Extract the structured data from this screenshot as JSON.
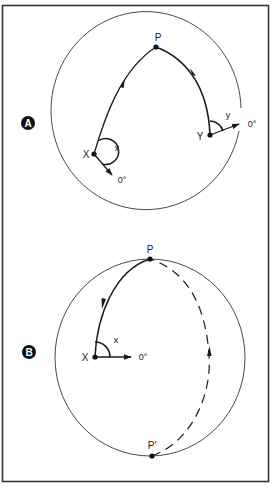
{
  "colors": {
    "ink": "#1a1a1a",
    "frame": "#333333",
    "background": "#ffffff"
  },
  "panels": [
    {
      "id": "A",
      "badge": "A",
      "points": {
        "P": "P",
        "X": "X",
        "Y": "Y"
      },
      "angles": {
        "x": "x",
        "y": "y"
      },
      "references": {
        "x_zero": "0°",
        "y_zero": "0°"
      }
    },
    {
      "id": "B",
      "badge": "B",
      "points": {
        "P": "P",
        "P_prime": "P′",
        "X": "X"
      },
      "angles": {
        "x": "x"
      },
      "references": {
        "x_zero": "0°"
      }
    }
  ]
}
